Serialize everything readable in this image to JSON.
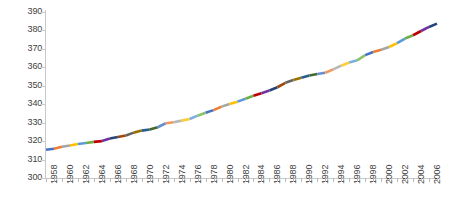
{
  "chart_data": {
    "type": "line",
    "title": "",
    "subtitle": "",
    "xlabel": "",
    "ylabel": "",
    "xlim": [
      1958,
      2007
    ],
    "ylim": [
      300,
      390
    ],
    "grid": false,
    "legend": false,
    "legend_position": "none",
    "y_ticks": [
      390,
      380,
      370,
      360,
      350,
      340,
      330,
      320,
      310,
      300
    ],
    "x_tick_labels": [
      "1958",
      "1960",
      "1962",
      "1964",
      "1966",
      "1968",
      "1970",
      "1972",
      "1974",
      "1976",
      "1978",
      "1980",
      "1982",
      "1984",
      "1986",
      "1988",
      "1990",
      "1992",
      "1994",
      "1996",
      "1998",
      "2000",
      "2002",
      "2004",
      "2006"
    ],
    "x_tick_interval_years": 2,
    "x_minor_tick_interval_years": 1,
    "series": [
      {
        "name": "CO2",
        "x": [
          1958,
          1959,
          1960,
          1961,
          1962,
          1963,
          1964,
          1965,
          1966,
          1967,
          1968,
          1969,
          1970,
          1971,
          1972,
          1973,
          1974,
          1975,
          1976,
          1977,
          1978,
          1979,
          1980,
          1981,
          1982,
          1983,
          1984,
          1985,
          1986,
          1987,
          1988,
          1989,
          1990,
          1991,
          1992,
          1993,
          1994,
          1995,
          1996,
          1997,
          1998,
          1999,
          2000,
          2001,
          2002,
          2003,
          2004,
          2005,
          2006,
          2007
        ],
        "values": [
          315.3,
          315.9,
          316.9,
          317.6,
          318.4,
          319.0,
          319.6,
          320.0,
          321.4,
          322.2,
          323.0,
          324.6,
          325.7,
          326.3,
          327.5,
          329.7,
          330.2,
          331.1,
          332.0,
          333.8,
          335.4,
          336.8,
          338.7,
          340.1,
          341.4,
          343.0,
          344.6,
          346.0,
          347.4,
          349.2,
          351.6,
          353.1,
          354.4,
          355.6,
          356.4,
          357.1,
          358.9,
          360.9,
          362.6,
          363.8,
          366.6,
          368.3,
          369.5,
          371.0,
          373.1,
          375.6,
          377.4,
          379.7,
          381.9,
          383.7
        ]
      }
    ],
    "series_colors": [
      "#4472c4",
      "#ed7d31",
      "#a5a5a5",
      "#ffc000",
      "#5b9bd5",
      "#70ad47",
      "#c00000",
      "#7030a0",
      "#264478",
      "#9e480e",
      "#636363",
      "#997300",
      "#255e91",
      "#43682b",
      "#698ed0",
      "#f1975a",
      "#b7b7b7",
      "#ffcd33",
      "#7cafdd",
      "#8cc168"
    ],
    "line_style": "multi-colored segmented"
  }
}
